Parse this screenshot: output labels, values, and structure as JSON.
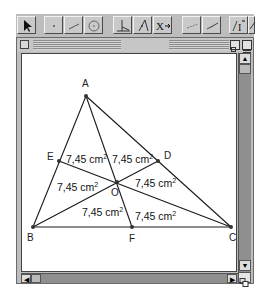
{
  "toolbar": {
    "tools": [
      {
        "name": "pointer-tool",
        "icon": "arrow-pointer-icon"
      },
      {
        "name": "point-tool",
        "icon": "point-icon"
      },
      {
        "name": "line-tool",
        "icon": "segment-icon"
      },
      {
        "name": "circle-tool",
        "icon": "circle-icon"
      },
      {
        "name": "construction-tool",
        "icon": "perpendicular-icon"
      },
      {
        "name": "midpoint-tool",
        "icon": "midpoint-icon"
      },
      {
        "name": "transform-tool",
        "icon": "transform-icon",
        "label": "X"
      },
      {
        "name": "measure-tool",
        "icon": "measure-icon"
      },
      {
        "name": "calculate-tool",
        "icon": "calculate-icon"
      },
      {
        "name": "text-tool",
        "icon": "text-icon",
        "label": "AI"
      },
      {
        "name": "draw-tool",
        "icon": "pencil-icon"
      }
    ]
  },
  "window": {
    "scrollbars": {
      "vertical": "scrollbar",
      "horizontal": "scrollbar"
    }
  },
  "diagram": {
    "points": {
      "A": {
        "label": "A",
        "x": 84,
        "y": 94
      },
      "B": {
        "label": "B",
        "x": 31,
        "y": 225
      },
      "C": {
        "label": "C",
        "x": 229,
        "y": 225
      },
      "D": {
        "label": "D",
        "x": 156,
        "y": 159
      },
      "E": {
        "label": "E",
        "x": 57,
        "y": 159
      },
      "F": {
        "label": "F",
        "x": 130,
        "y": 225
      },
      "O": {
        "label": "O",
        "x": 115,
        "y": 180
      }
    },
    "areas": [
      {
        "value": "7,45 cm",
        "unit_exp": "2",
        "x": 64,
        "y": 161
      },
      {
        "value": "7,45 cm",
        "unit_exp": "2",
        "x": 110,
        "y": 161
      },
      {
        "value": "7,45 cm",
        "unit_exp": "2",
        "x": 55,
        "y": 189
      },
      {
        "value": "7,45 cm",
        "unit_exp": "2",
        "x": 133,
        "y": 185
      },
      {
        "value": "7,45 cm",
        "unit_exp": "2",
        "x": 80,
        "y": 214
      },
      {
        "value": "7,45 cm",
        "unit_exp": "2",
        "x": 133,
        "y": 218
      }
    ],
    "colors": {
      "line": "#1a1a1a",
      "point": "#333333"
    }
  }
}
